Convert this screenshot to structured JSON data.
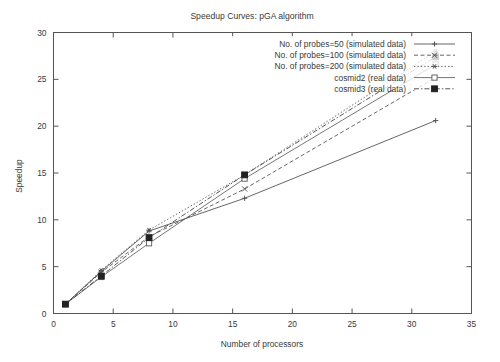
{
  "chart_data": {
    "type": "line",
    "title": "Speedup Curves: pGA algorithm",
    "xlabel": "Number of processors",
    "ylabel": "Speedup",
    "xlim": [
      0,
      35
    ],
    "ylim": [
      0,
      30
    ],
    "xticks": [
      0,
      5,
      10,
      15,
      20,
      25,
      30,
      35
    ],
    "yticks": [
      0,
      5,
      10,
      15,
      20,
      25,
      30
    ],
    "grid": false,
    "legend_position": "top-right inside",
    "series": [
      {
        "name": "No. of probes=50 (simulated data)",
        "marker": "plus",
        "dash": "solid",
        "color": "#555555",
        "x": [
          1,
          4,
          8,
          16,
          32
        ],
        "y": [
          1.0,
          4.5,
          8.8,
          12.3,
          20.6
        ]
      },
      {
        "name": "No. of probes=100 (simulated data)",
        "marker": "cross",
        "dash": "dashed",
        "color": "#555555",
        "x": [
          1,
          4,
          8,
          16,
          32
        ],
        "y": [
          1.0,
          4.4,
          8.2,
          13.3,
          25.2
        ]
      },
      {
        "name": "No. of probes=200 (simulated data)",
        "marker": "star",
        "dash": "dotted",
        "color": "#555555",
        "x": [
          1,
          4,
          8,
          16,
          32
        ],
        "y": [
          1.0,
          4.6,
          8.9,
          14.8,
          28.0
        ]
      },
      {
        "name": "cosmid2 (real data)",
        "marker": "open-square",
        "dash": "solid",
        "color": "#666666",
        "x": [
          1,
          4,
          8,
          16,
          32
        ],
        "y": [
          1.0,
          3.9,
          7.5,
          14.4,
          26.6
        ]
      },
      {
        "name": "cosmid3 (real data)",
        "marker": "filled-square",
        "dash": "dash-dot",
        "color": "#444444",
        "x": [
          1,
          4,
          8,
          16,
          32
        ],
        "y": [
          1.0,
          4.0,
          8.1,
          14.8,
          27.4
        ]
      }
    ]
  },
  "legend": {
    "items": [
      {
        "label": "No. of probes=50 (simulated data)"
      },
      {
        "label": "No. of probes=100 (simulated data)"
      },
      {
        "label": "No. of probes=200 (simulated data)"
      },
      {
        "label": "cosmid2 (real data)"
      },
      {
        "label": "cosmid3 (real data)"
      }
    ]
  },
  "axes": {
    "x_tick_labels": [
      "0",
      "5",
      "10",
      "15",
      "20",
      "25",
      "30",
      "35"
    ],
    "y_tick_labels": [
      "0",
      "5",
      "10",
      "15",
      "20",
      "25",
      "30"
    ]
  }
}
